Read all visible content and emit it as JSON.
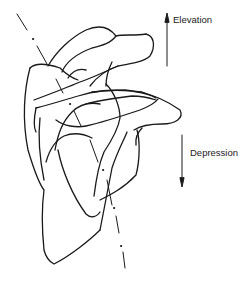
{
  "figure": {
    "labels": {
      "elevation": "Elevation",
      "depression": "Depression"
    },
    "arrows": {
      "elevation": {
        "direction": "up",
        "label": "Elevation"
      },
      "depression": {
        "direction": "down",
        "label": "Depression"
      }
    },
    "colors": {
      "line": "#1a1a1a",
      "background": "#ffffff"
    }
  }
}
